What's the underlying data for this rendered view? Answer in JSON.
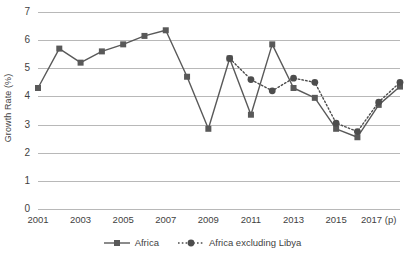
{
  "chart_data": {
    "type": "line",
    "title": "",
    "subtitle": "",
    "xlabel": "",
    "ylabel": "Growth Rate (%)",
    "ylim": [
      0,
      7
    ],
    "ytick_values": [
      0,
      1,
      2,
      3,
      4,
      5,
      6,
      7
    ],
    "ytick_labels": [
      "0",
      "1",
      "2",
      "3",
      "4",
      "5",
      "6",
      "7"
    ],
    "grid": true,
    "grid_axis": "y",
    "legend_position": "bottom",
    "x": [
      2001,
      2002,
      2003,
      2004,
      2005,
      2006,
      2007,
      2008,
      2009,
      2010,
      2011,
      2012,
      2013,
      2014,
      2015,
      2016,
      2017,
      2018
    ],
    "xtick_values": [
      2001,
      2003,
      2005,
      2007,
      2009,
      2011,
      2013,
      2015,
      2017
    ],
    "xtick_labels": [
      "2001",
      "2003",
      "2005",
      "2007",
      "2009",
      "2011",
      "2013",
      "2015",
      "2017 (p)"
    ],
    "series": [
      {
        "name": "Africa",
        "marker": "square",
        "linestyle": "solid",
        "color": "#595959",
        "values": [
          4.3,
          5.7,
          5.2,
          5.6,
          5.85,
          6.15,
          6.35,
          4.7,
          2.85,
          5.35,
          3.35,
          5.85,
          4.3,
          3.95,
          2.85,
          2.55,
          3.7,
          4.35
        ]
      },
      {
        "name": "Africa excluding Libya",
        "marker": "circle",
        "linestyle": "dotted",
        "color": "#4d4d4d",
        "values": [
          null,
          null,
          null,
          null,
          null,
          null,
          null,
          null,
          null,
          5.35,
          4.6,
          4.2,
          4.65,
          4.5,
          3.05,
          2.75,
          3.8,
          4.5
        ]
      }
    ],
    "colors": {
      "series_1": "#595959",
      "series_2": "#4d4d4d",
      "gridline": "#b8b8b8",
      "text": "#3f3f3f",
      "background": "#ffffff"
    }
  },
  "legend": {
    "entries": [
      {
        "label": "Africa"
      },
      {
        "label": "Africa excluding Libya"
      }
    ]
  }
}
